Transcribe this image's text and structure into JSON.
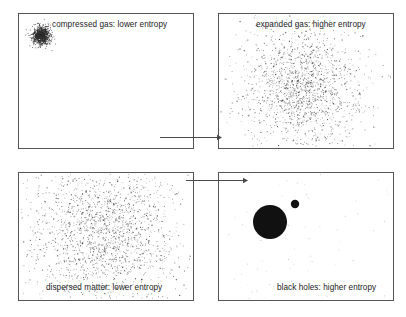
{
  "figure": {
    "background_color": "#ffffff",
    "panel_border_color": "#555555",
    "arrow_color": "#4a4a4a",
    "particle_color": "#2b2b2b",
    "blackhole_color": "#111111",
    "panels": [
      {
        "id": "p1",
        "name": "compressed-gas-panel",
        "label": "compressed gas: lower entropy",
        "label_align": "right",
        "label_vertical": "top",
        "content": "dense-particle-cluster",
        "x": 18,
        "y": 13,
        "width": 175,
        "height": 135,
        "cluster": {
          "cx": 41,
          "cy": 35,
          "sigma": 4.5,
          "count": 900
        }
      },
      {
        "id": "p2",
        "name": "expanded-gas-panel",
        "label": "expanded gas: higher entropy",
        "label_align": "right",
        "label_vertical": "top",
        "content": "diffuse-particle-cloud",
        "x": 218,
        "y": 13,
        "width": 175,
        "height": 135,
        "cluster": {
          "cx": 302,
          "cy": 88,
          "sigma": 30,
          "count": 1600
        }
      },
      {
        "id": "p3",
        "name": "dispersed-matter-panel",
        "label": "dispersed matter: lower entropy",
        "label_align": "center",
        "label_vertical": "bottom",
        "content": "diffuse-particle-cloud",
        "x": 18,
        "y": 172,
        "width": 175,
        "height": 128,
        "cluster": {
          "cx": 104,
          "cy": 232,
          "sigma": 36,
          "count": 1900
        }
      },
      {
        "id": "p4",
        "name": "black-holes-panel",
        "label": "black holes: higher entropy",
        "label_align": "right",
        "label_vertical": "bottom",
        "content": "two-black-holes-sparse-field",
        "x": 218,
        "y": 172,
        "width": 175,
        "height": 128,
        "sparse": {
          "count": 70
        },
        "black_holes": [
          {
            "name": "large-black-hole",
            "cx": 270,
            "cy": 222,
            "r": 17
          },
          {
            "name": "small-black-hole",
            "cx": 295,
            "cy": 204,
            "r": 4.2
          }
        ]
      }
    ],
    "arrows": [
      {
        "name": "arrow-compressed-to-expanded",
        "x1": 160,
        "y1": 137,
        "x2": 222,
        "y2": 137
      },
      {
        "name": "arrow-dispersed-to-blackholes",
        "x1": 186,
        "y1": 180,
        "x2": 248,
        "y2": 180
      }
    ]
  }
}
